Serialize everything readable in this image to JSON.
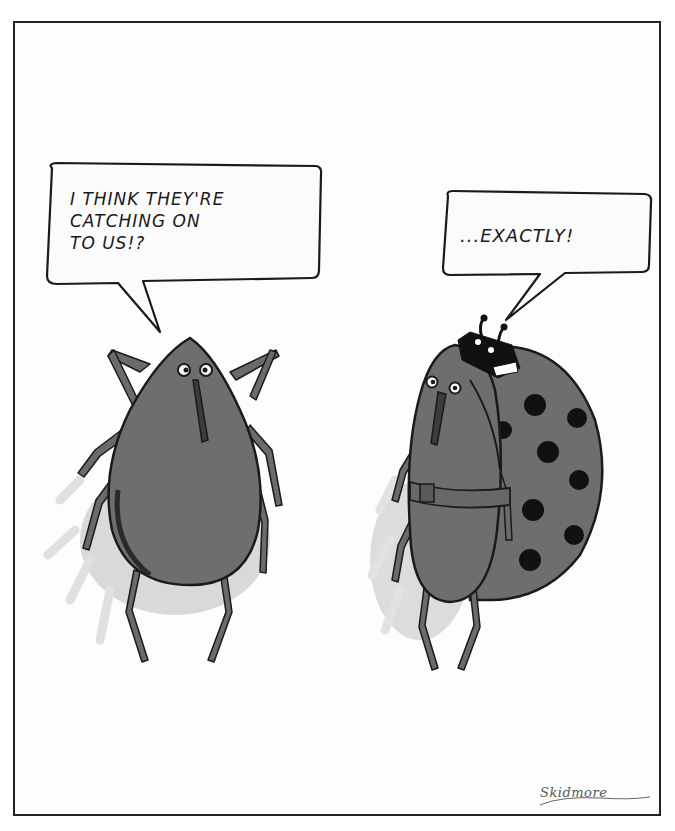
{
  "cartoon": {
    "speech_left": {
      "speaker": "tick",
      "text": "I THINK THEY'RE\nCATCHING ON\nTO US!?"
    },
    "speech_right": {
      "speaker": "tick-in-ladybug-costume",
      "text": "...EXACTLY!"
    },
    "signature": "Skidmore"
  },
  "colors": {
    "frame_border": "#222222",
    "background": "#fdfdfd",
    "bug_body": "#6e6e6e",
    "bug_outline": "#1a1a1a",
    "shadow": "#cfcfcf",
    "spot": "#111111"
  }
}
